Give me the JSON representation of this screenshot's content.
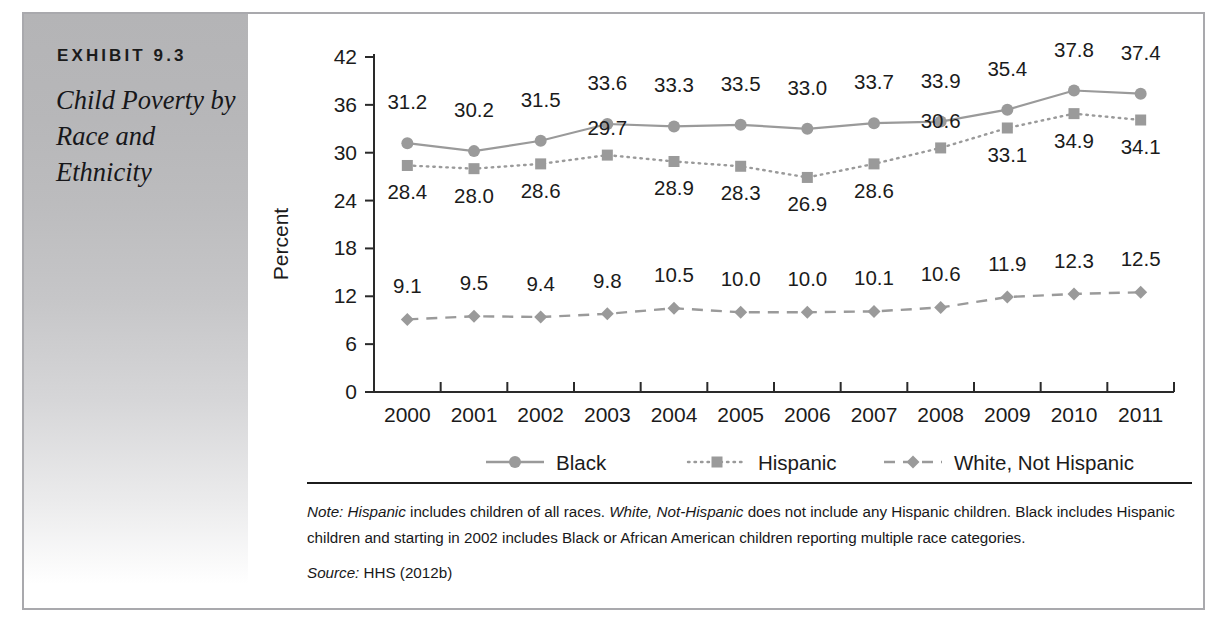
{
  "exhibit": {
    "number": "EXHIBIT 9.3",
    "title": "Child Poverty by Race and Ethnicity"
  },
  "chart_data": {
    "type": "line",
    "title": "",
    "xlabel": "",
    "ylabel": "Percent",
    "categories": [
      "2000",
      "2001",
      "2002",
      "2003",
      "2004",
      "2005",
      "2006",
      "2007",
      "2008",
      "2009",
      "2010",
      "2011"
    ],
    "ylim": [
      0,
      42
    ],
    "yticks": [
      0,
      6,
      12,
      18,
      24,
      30,
      36,
      42
    ],
    "grid": false,
    "legend_position": "bottom",
    "series": [
      {
        "name": "Black",
        "marker": "circle",
        "line_style": "solid",
        "color": "#9a9a9a",
        "values": [
          31.2,
          30.2,
          31.5,
          33.6,
          33.3,
          33.5,
          33.0,
          33.7,
          33.9,
          35.4,
          37.8,
          37.4
        ]
      },
      {
        "name": "Hispanic",
        "marker": "square",
        "line_style": "dotted",
        "color": "#9a9a9a",
        "values": [
          28.4,
          28.0,
          28.6,
          29.7,
          28.9,
          28.3,
          26.9,
          28.6,
          30.6,
          33.1,
          34.9,
          34.1
        ]
      },
      {
        "name": "White, Not Hispanic",
        "marker": "diamond",
        "line_style": "dashed",
        "color": "#9a9a9a",
        "values": [
          9.1,
          9.5,
          9.4,
          9.8,
          10.5,
          10.0,
          10.0,
          10.1,
          10.6,
          11.9,
          12.3,
          12.5
        ]
      }
    ]
  },
  "note": {
    "rule": true,
    "paragraph_html": "<em>Note:</em> <em>Hispanic</em> includes children of all races. <em>White, Not-Hispanic</em> does not include any Hispanic children. Black includes Hispanic children and starting in 2002 includes Black or African American children reporting multiple race categories.",
    "source_html": "<em>Source:</em> HHS (2012b)"
  },
  "colors": {
    "panel_top": "#b4b4b6",
    "frame": "#a9a9ad",
    "series_gray": "#9a9a9a",
    "text": "#1b1b1b"
  }
}
